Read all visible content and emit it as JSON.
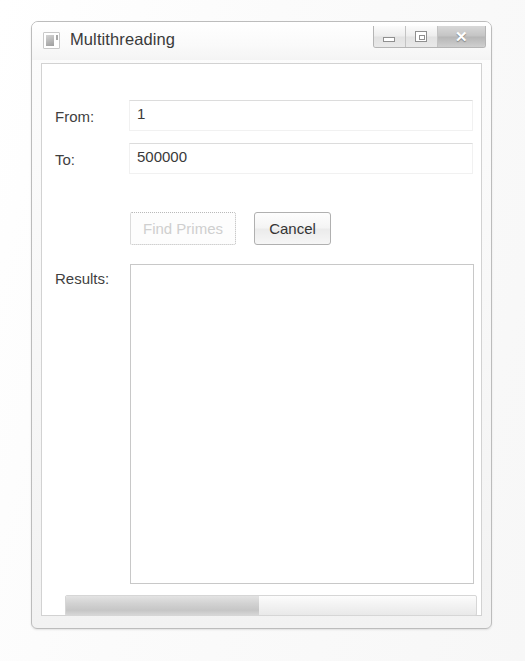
{
  "window": {
    "title": "Multithreading",
    "app_icon": "application-icon",
    "controls": {
      "minimize_label": "–",
      "maximize_label": "□",
      "close_label": "✕"
    }
  },
  "form": {
    "from": {
      "label": "From:",
      "value": "1",
      "placeholder": ""
    },
    "to": {
      "label": "To:",
      "value": "500000",
      "placeholder": ""
    },
    "results": {
      "label": "Results:",
      "value": "",
      "placeholder": ""
    }
  },
  "buttons": {
    "find_primes": {
      "label": "Find Primes",
      "enabled": false
    },
    "cancel": {
      "label": "Cancel",
      "enabled": true
    }
  },
  "progress": {
    "percent": 47,
    "value_text": ""
  },
  "colors": {
    "window_border": "#bcbcbc",
    "client_background": "#ffffff",
    "text": "#3a3a3a",
    "disabled_text": "#cfcfcf",
    "progress_fill": "#c6c6c6"
  }
}
